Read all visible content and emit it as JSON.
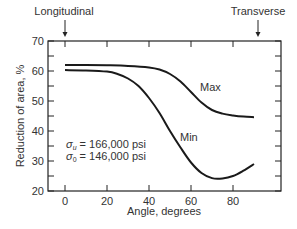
{
  "chart_data": {
    "type": "line",
    "title": "",
    "xlabel": "Angle, degrees",
    "ylabel": "Reduction of area, %",
    "xlim": [
      -6,
      103
    ],
    "ylim": [
      20,
      70
    ],
    "xticks": [
      0,
      20,
      40,
      60,
      80
    ],
    "yticks": [
      20,
      30,
      40,
      50,
      60,
      70
    ],
    "grid": false,
    "legend": "inline labels",
    "series": [
      {
        "name": "Max",
        "x": [
          0,
          10,
          20,
          30,
          40,
          45,
          50,
          55,
          60,
          65,
          70,
          75,
          80,
          85,
          90
        ],
        "values": [
          62,
          62,
          61.9,
          61.7,
          61.2,
          60.5,
          59,
          56.5,
          53,
          49.5,
          47,
          45.8,
          45.2,
          44.8,
          44.6
        ]
      },
      {
        "name": "Min",
        "x": [
          0,
          10,
          20,
          25,
          30,
          35,
          40,
          45,
          50,
          55,
          60,
          65,
          70,
          75,
          80,
          85,
          90
        ],
        "values": [
          60.3,
          60.2,
          59.8,
          59,
          57.5,
          55,
          51,
          46,
          40,
          34.5,
          29.5,
          26,
          24.3,
          24.2,
          25,
          26.8,
          29
        ]
      }
    ],
    "annotations": [
      {
        "text": "Longitudinal",
        "x": 0,
        "position": "top",
        "arrow": true
      },
      {
        "text": "Transverse",
        "x": 90,
        "position": "top",
        "arrow": true
      },
      {
        "text": "σu = 166,000 psi",
        "x": 3,
        "y": 33
      },
      {
        "text": "σ0 = 146,000 psi",
        "x": 3,
        "y": 29.5
      },
      {
        "text": "Max",
        "x": 65,
        "y": 52.5
      },
      {
        "text": "Min",
        "x": 55,
        "y": 37
      }
    ]
  },
  "labels": {
    "longitudinal": "Longitudinal",
    "transverse": "Transverse",
    "max": "Max",
    "min": "Min",
    "ylabel": "Reduction of area, %",
    "xlabel": "Angle, degrees",
    "sigma_u_sym": "σ",
    "sigma_u_sub": "u",
    "sigma_u_val": " = 166,000 psi",
    "sigma_0_sym": "σ",
    "sigma_0_sub": "0",
    "sigma_0_val": " = 146,000 psi"
  }
}
